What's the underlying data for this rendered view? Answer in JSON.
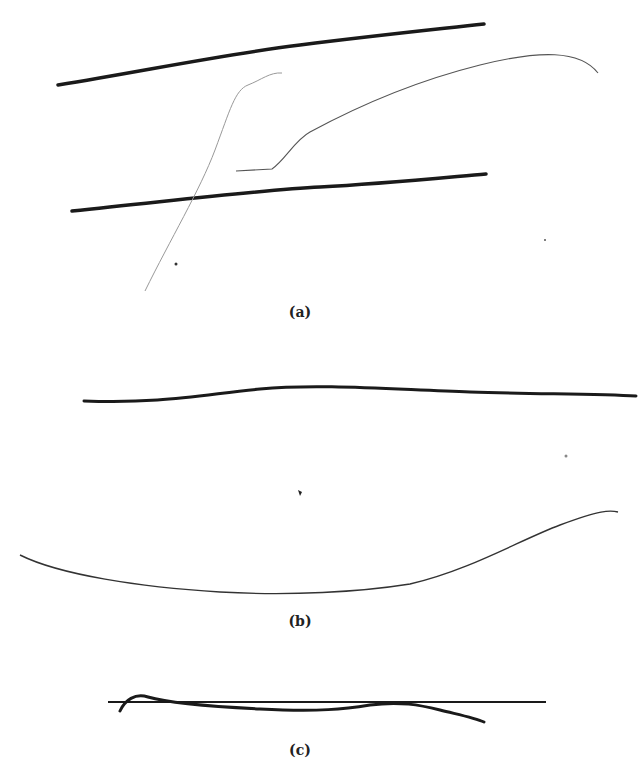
{
  "figure": {
    "panels": [
      {
        "id": "a",
        "label": "(a)",
        "label_pos": {
          "x": 300,
          "y": 310
        }
      },
      {
        "id": "b",
        "label": "(b)",
        "label_pos": {
          "x": 300,
          "y": 620
        }
      },
      {
        "id": "c",
        "label": "(c)",
        "label_pos": {
          "x": 300,
          "y": 748
        }
      }
    ],
    "stroke_color": "#1a1a1a",
    "faint_stroke_color": "#777777"
  }
}
